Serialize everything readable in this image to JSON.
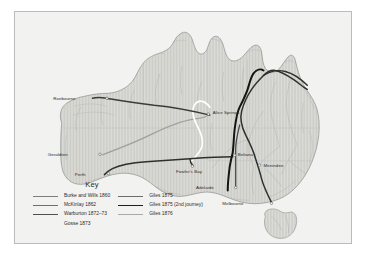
{
  "map": {
    "title": "Australia — inland exploration routes 1860-1876",
    "background_color": "#f2f2f0",
    "frame_color": "#b9bcbd",
    "land_color": "#d8d8d4",
    "coast_color": "#8d8f8d",
    "river_color": "#a9aba8",
    "border_line_color": "#b4b6b3",
    "cities": [
      {
        "name": "Roebourne",
        "x": 63.0,
        "y": 88.0,
        "dot_x": 92.5,
        "dot_y": 87.0,
        "side": "left-of-dot"
      },
      {
        "name": "Geraldton",
        "x": 55.0,
        "y": 144.0,
        "dot_x": 85.5,
        "dot_y": 143.5,
        "side": "left-of-dot"
      },
      {
        "name": "Perth",
        "x": 73.0,
        "y": 164.0,
        "dot_x": 94.0,
        "dot_y": 163.0,
        "side": "left-of-dot"
      },
      {
        "name": "Alice Springs",
        "x": 199.0,
        "y": 102.0,
        "dot_x": 194.5,
        "dot_y": 103.0,
        "side": "right-of-dot"
      },
      {
        "name": "Fowler's Bay",
        "x": 162.0,
        "y": 161.0,
        "dot_x": 178.5,
        "dot_y": 155.5,
        "side": "right-of-dot"
      },
      {
        "name": "Beltana",
        "x": 224.0,
        "y": 144.0,
        "dot_x": 221.0,
        "dot_y": 144.5,
        "side": "right-of-dot"
      },
      {
        "name": "Menindee",
        "x": 250.0,
        "y": 155.0,
        "dot_x": 246.0,
        "dot_y": 154.5,
        "side": "right-of-dot"
      },
      {
        "name": "Adelaide",
        "x": 202.0,
        "y": 178.0,
        "dot_x": 222.0,
        "dot_y": 177.0,
        "side": "left-of-dot"
      },
      {
        "name": "Melbourne",
        "x": 232.0,
        "y": 194.0,
        "dot_x": 258.0,
        "dot_y": 193.0,
        "side": "left-of-dot"
      }
    ]
  },
  "key": {
    "title": "Key",
    "columns": [
      {
        "entries": [
          {
            "label": "Burke and Wills 1860",
            "color": "#7c7e7c",
            "width": 1.3
          },
          {
            "label": "McKinlay 1862",
            "color": "#6e706e",
            "width": 1.3
          },
          {
            "label": "Warburton 1872–73",
            "color": "#4f514f",
            "width": 1.5
          },
          {
            "label": "Gosse 1873",
            "color": "#f4f4f2",
            "width": 0.0
          }
        ]
      },
      {
        "entries": [
          {
            "label": "Giles 1875",
            "color": "#6b6d6b",
            "width": 1.3
          },
          {
            "label": "Giles 1875 (2nd journey)",
            "color": "#1d1f1d",
            "width": 1.9
          },
          {
            "label": "Giles 1876",
            "color": "#a9aba9",
            "width": 1.2
          }
        ]
      }
    ]
  },
  "routes": [
    {
      "name": "burke-and-wills-1860",
      "color": "#2e302e",
      "width": 1.5
    },
    {
      "name": "mckinlay-1862",
      "color": "#4a4c4a",
      "width": 1.3
    },
    {
      "name": "warburton-1872-73",
      "color": "#3a3c3a",
      "width": 1.5
    },
    {
      "name": "gosse-1873",
      "color": "#ffffff",
      "width": 1.6
    },
    {
      "name": "giles-1875",
      "color": "#6b6d6b",
      "width": 1.3
    },
    {
      "name": "giles-1875-2nd",
      "color": "#131513",
      "width": 2.0
    },
    {
      "name": "giles-1876",
      "color": "#9fa19f",
      "width": 1.3
    }
  ]
}
